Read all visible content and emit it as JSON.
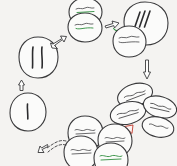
{
  "diagram": {
    "type": "cycle",
    "background_color": "#f4f3f1",
    "ink_color": "#3a3a3c",
    "accent_green": "#2f8f3e",
    "accent_red": "#c0392b",
    "note": "Hand-drawn circular sequence of dividing cells; handwritten labels are illegible scribbles at this resolution",
    "nodes": [
      {
        "id": "node-interphase-single",
        "position": "left-lower",
        "shape": "single round cell",
        "chromosome_marks": 1,
        "labels": []
      },
      {
        "id": "node-prophase-double",
        "position": "left-upper",
        "shape": "single round cell",
        "chromosome_marks": 2,
        "labels": []
      },
      {
        "id": "node-two-cell-stack",
        "position": "top-left",
        "shape": "two stacked round cells",
        "chromosome_marks": 0,
        "labels": [
          {
            "text": "~~~~",
            "color": "#3a3a3c",
            "underline_color": "#2f8f3e"
          },
          {
            "text": "~~~~",
            "color": "#3a3a3c",
            "underline_color": "#2f8f3e"
          }
        ]
      },
      {
        "id": "node-metaphase-spindle",
        "position": "top-right",
        "shape": "large cell with small cell attached",
        "chromosome_marks": 3,
        "labels": [
          {
            "text": "~~~~",
            "color": "#3a3a3c"
          },
          {
            "text": "~~~~",
            "color": "#3a3a3c"
          }
        ]
      },
      {
        "id": "node-four-cell-cluster",
        "position": "right-lower",
        "shape": "cluster of four oval cells",
        "chromosome_marks": 0,
        "labels": [
          {
            "text": "~~~~",
            "color": "#3a3a3c"
          },
          {
            "text": "~~~~",
            "color": "#3a3a3c"
          },
          {
            "text": "~~~~",
            "color": "#3a3a3c"
          },
          {
            "text": "~~~~",
            "color": "#3a3a3c"
          }
        ]
      },
      {
        "id": "node-bottom-cluster",
        "position": "bottom-center",
        "shape": "cluster of four round cells",
        "chromosome_marks": 0,
        "labels": [
          {
            "text": "~~~~",
            "color": "#3a3a3c"
          },
          {
            "text": "~~~~",
            "color": "#3a3a3c"
          },
          {
            "text": "~~~~",
            "color": "#3a3a3c"
          },
          {
            "text": "~~~~",
            "color": "#2f8f3e"
          }
        ]
      }
    ],
    "arrows": [
      {
        "id": "arrow-up-left",
        "direction": "up",
        "color": "#3a3a3c",
        "style": "outline"
      },
      {
        "id": "arrow-upper-left",
        "direction": "up-right",
        "color": "#3a3a3c",
        "style": "outline"
      },
      {
        "id": "arrow-top",
        "direction": "right",
        "color": "#3a3a3c",
        "style": "outline-green-tip"
      },
      {
        "id": "arrow-right",
        "direction": "down",
        "color": "#3a3a3c",
        "style": "outline"
      },
      {
        "id": "arrow-bottom-right",
        "direction": "up-left",
        "color": "#c0392b",
        "style": "outline-red"
      },
      {
        "id": "arrow-bottom-left",
        "direction": "left",
        "color": "#3a3a3c",
        "style": "dashed"
      }
    ]
  }
}
